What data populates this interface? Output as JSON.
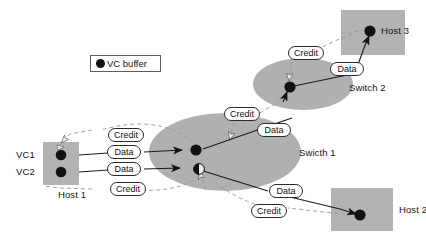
{
  "diagram": {
    "legend": {
      "icon": "filled-circle-icon",
      "label": "VC buffer"
    },
    "nodes": [
      {
        "id": "host1",
        "label": "Host 1",
        "shape": "rectangle",
        "fill": "#b3b3b3"
      },
      {
        "id": "switch1",
        "label": "Swicth 1",
        "shape": "ellipse",
        "fill": "#b0b0b0"
      },
      {
        "id": "switch2",
        "label": "Switch 2",
        "shape": "ellipse",
        "fill": "#b0b0b0"
      },
      {
        "id": "host2",
        "label": "Host 2",
        "shape": "rectangle",
        "fill": "#b3b3b3"
      },
      {
        "id": "host3",
        "label": "Host 3",
        "shape": "rectangle",
        "fill": "#b3b3b3"
      }
    ],
    "vc_labels": [
      {
        "id": "vc1",
        "label": "VC1"
      },
      {
        "id": "vc2",
        "label": "VC2"
      }
    ],
    "buffers": [
      {
        "id": "host1-vc1",
        "node": "host1",
        "fill": "full"
      },
      {
        "id": "host1-vc2",
        "node": "host1",
        "fill": "full"
      },
      {
        "id": "switch1-vc1",
        "node": "switch1",
        "fill": "full"
      },
      {
        "id": "switch1-vc2",
        "node": "switch1",
        "fill": "half"
      },
      {
        "id": "switch2-vc1",
        "node": "switch2",
        "fill": "full"
      },
      {
        "id": "host2-vc1",
        "node": "host2",
        "fill": "full"
      },
      {
        "id": "host3-vc1",
        "node": "host3",
        "fill": "full"
      }
    ],
    "edge_labels": [
      {
        "id": "credit-h1-s1-top",
        "text": "Credit",
        "kind": "credit"
      },
      {
        "id": "data-vc1-s1",
        "text": "Data",
        "kind": "data"
      },
      {
        "id": "data-vc2-s1",
        "text": "Data",
        "kind": "data"
      },
      {
        "id": "credit-h1-s1-bot",
        "text": "Credit",
        "kind": "credit"
      },
      {
        "id": "credit-s1-s2",
        "text": "Credit",
        "kind": "credit"
      },
      {
        "id": "data-s1-s2",
        "text": "Data",
        "kind": "data"
      },
      {
        "id": "credit-s2-h3",
        "text": "Credit",
        "kind": "credit"
      },
      {
        "id": "data-s2-h3",
        "text": "Data",
        "kind": "data"
      },
      {
        "id": "data-s1-h2",
        "text": "Data",
        "kind": "data"
      },
      {
        "id": "credit-h2-s1",
        "text": "Credit",
        "kind": "credit"
      }
    ],
    "colors": {
      "node_fill": "#b0b0b0",
      "buffer": "#111111",
      "data_line": "#1a1a1a",
      "credit_line": "#8a8a8a",
      "label_border": "#2b2b2b",
      "text": "#141414"
    }
  }
}
